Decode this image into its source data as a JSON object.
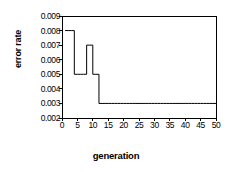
{
  "chart_data": {
    "type": "line",
    "title": "",
    "xlabel": "generation",
    "ylabel": "error rate",
    "xlim": [
      0,
      50
    ],
    "ylim": [
      0.002,
      0.009
    ],
    "xticks": [
      0,
      5,
      10,
      15,
      20,
      25,
      30,
      35,
      40,
      45,
      50
    ],
    "xtick_labels": [
      "0",
      "5",
      "10",
      "15",
      "20",
      "25",
      "30",
      "35",
      "40",
      "45",
      "50"
    ],
    "yticks": [
      0.002,
      0.003,
      0.004,
      0.005,
      0.006,
      0.007,
      0.008,
      0.009
    ],
    "ytick_labels": [
      "0.002",
      "0.003",
      "0.004",
      "0.005",
      "0.006",
      "0.007",
      "0.008",
      "0.009"
    ],
    "grid": false,
    "legend": false,
    "legend_position": "none",
    "line_color": "#000000",
    "line_width": 1,
    "frame_color": "#000000",
    "background": "#ffffff",
    "series": [
      {
        "name": "error rate",
        "x": [
          1,
          2,
          3,
          4,
          5,
          6,
          7,
          8,
          9,
          10,
          11,
          12,
          13,
          14,
          15,
          16,
          17,
          18,
          19,
          20,
          21,
          22,
          23,
          24,
          25,
          26,
          27,
          28,
          29,
          30,
          31,
          32,
          33,
          34,
          35,
          36,
          37,
          38,
          39,
          40,
          41,
          42,
          43,
          44,
          45,
          46,
          47,
          48,
          49,
          50
        ],
        "values": [
          0.008,
          0.008,
          0.008,
          0.005,
          0.005,
          0.005,
          0.005,
          0.007,
          0.007,
          0.005,
          0.005,
          0.003,
          0.003,
          0.003,
          0.003,
          0.003,
          0.003,
          0.003,
          0.003,
          0.003,
          0.003,
          0.003,
          0.003,
          0.003,
          0.003,
          0.003,
          0.003,
          0.003,
          0.003,
          0.003,
          0.003,
          0.003,
          0.003,
          0.003,
          0.003,
          0.003,
          0.003,
          0.003,
          0.003,
          0.003,
          0.003,
          0.003,
          0.003,
          0.003,
          0.003,
          0.003,
          0.003,
          0.003,
          0.003,
          0.003
        ]
      }
    ]
  }
}
